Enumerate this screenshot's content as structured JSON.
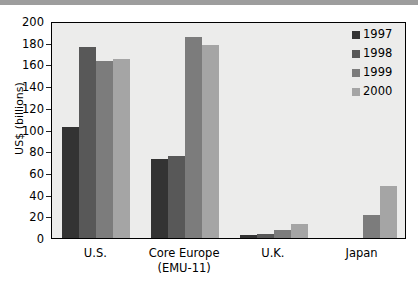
{
  "chart_data": {
    "type": "bar",
    "title": "",
    "xlabel": "",
    "ylabel": "US$ (billions)",
    "ylim": [
      0,
      200
    ],
    "yticks": [
      0,
      20,
      40,
      60,
      80,
      100,
      120,
      140,
      160,
      180,
      200
    ],
    "grid": false,
    "legend_position": "top-right",
    "categories": [
      "U.S.",
      "Core Europe (EMU-11)",
      "U.K.",
      "Japan"
    ],
    "category_labels": [
      {
        "line1": "U.S.",
        "line2": ""
      },
      {
        "line1": "Core Europe",
        "line2": "(EMU-11)"
      },
      {
        "line1": "U.K.",
        "line2": ""
      },
      {
        "line1": "Japan",
        "line2": ""
      }
    ],
    "series": [
      {
        "name": "1997",
        "color": "#333333",
        "values": [
          102,
          73,
          3,
          0
        ]
      },
      {
        "name": "1998",
        "color": "#585858",
        "values": [
          176,
          76,
          4,
          0
        ]
      },
      {
        "name": "1999",
        "color": "#7c7c7c",
        "values": [
          163,
          185,
          7,
          21
        ]
      },
      {
        "name": "2000",
        "color": "#a5a5a5",
        "values": [
          165,
          178,
          13,
          48
        ]
      }
    ]
  },
  "legend": {
    "items": [
      {
        "label": "1997",
        "color": "#333333"
      },
      {
        "label": "1998",
        "color": "#585858"
      },
      {
        "label": "1999",
        "color": "#7c7c7c"
      },
      {
        "label": "2000",
        "color": "#a5a5a5"
      }
    ]
  },
  "axes": {
    "y_title": "US$ (billions)"
  },
  "colors": {
    "plot_background": "#ececeb",
    "page_background": "#ffffff",
    "axis": "#000000",
    "top_band": "#9d9d9d"
  }
}
